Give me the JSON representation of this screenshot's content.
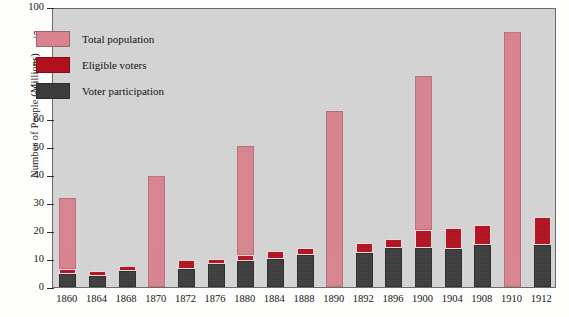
{
  "chart_data": {
    "type": "bar",
    "title": "",
    "xlabel": "",
    "ylabel": "Number of People (Millions)",
    "ylim": [
      0,
      100
    ],
    "yticks": [
      0,
      10,
      20,
      30,
      40,
      50,
      60,
      70,
      80,
      90,
      100
    ],
    "grid": false,
    "stacked": true,
    "legend_position": "inside-top-left",
    "categories": [
      "1860",
      "1864",
      "1868",
      "1870",
      "1872",
      "1876",
      "1880",
      "1884",
      "1888",
      "1890",
      "1892",
      "1896",
      "1900",
      "1904",
      "1908",
      "1910",
      "1912"
    ],
    "series": [
      {
        "name": "Voter participation",
        "color": "#3c3c3c",
        "values": [
          4.7,
          4.0,
          5.7,
          null,
          6.5,
          8.2,
          9.2,
          10.0,
          11.4,
          null,
          12.1,
          13.9,
          13.9,
          13.5,
          14.9,
          null,
          15.0
        ]
      },
      {
        "name": "Eligible voters",
        "color": "#b2101f",
        "values": [
          6.5,
          5.6,
          7.5,
          null,
          9.5,
          10.1,
          11.3,
          12.8,
          14.0,
          null,
          15.8,
          17.0,
          20.2,
          21.0,
          22.0,
          null,
          25.0
        ]
      },
      {
        "name": "Total population",
        "color": "#d9838f",
        "values": [
          31.8,
          5.6,
          7.5,
          39.8,
          9.5,
          10.1,
          50.2,
          12.8,
          14.0,
          62.9,
          15.8,
          17.0,
          75.2,
          21.0,
          22.0,
          91.1,
          25.0
        ]
      }
    ]
  },
  "legend": {
    "items": [
      {
        "label": "Total population",
        "color": "#d9838f",
        "swatch": "pink-swatch"
      },
      {
        "label": "Eligible voters",
        "color": "#b2101f",
        "swatch": "red-swatch"
      },
      {
        "label": "Voter participation",
        "color": "#3c3c3c",
        "swatch": "dark-swatch"
      }
    ]
  }
}
